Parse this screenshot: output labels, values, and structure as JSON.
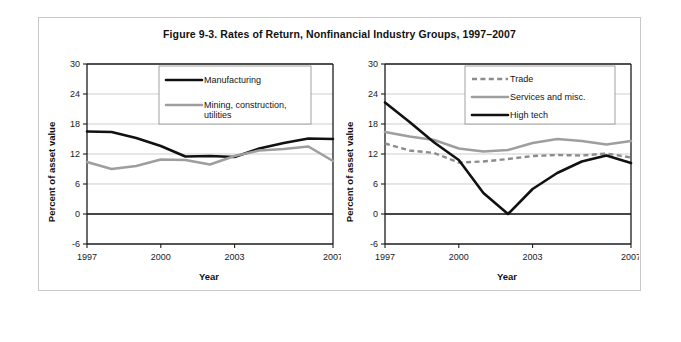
{
  "figure": {
    "title": "Figure 9-3. Rates of Return, Nonfinancial Industry Groups, 1997–2007"
  },
  "axis": {
    "ylabel": "Percent of asset value",
    "xlabel": "Year",
    "ytick_labels": [
      "30",
      "24",
      "18",
      "12",
      "6",
      "0",
      "-6"
    ],
    "xtick_labels": [
      "1997",
      "2000",
      "2003",
      "2007"
    ]
  },
  "legend_left": {
    "items": [
      {
        "label": "Manufacturing",
        "style": "solid-black",
        "color": "#111111"
      },
      {
        "label": "Mining, construction,",
        "label2": "utilities",
        "style": "solid-gray",
        "color": "#9e9e9e"
      }
    ]
  },
  "legend_right": {
    "items": [
      {
        "label": "Trade",
        "style": "dashed-gray",
        "color": "#8c8c8c"
      },
      {
        "label": "Services and misc.",
        "style": "solid-gray",
        "color": "#9e9e9e"
      },
      {
        "label": "High tech",
        "style": "solid-black",
        "color": "#111111"
      }
    ]
  },
  "chart_data": [
    {
      "type": "line",
      "title": "Rates of Return, Nonfinancial Industry Groups, 1997–2007 (panel 1)",
      "xlabel": "Year",
      "ylabel": "Percent of asset value",
      "x": [
        1997,
        1998,
        1999,
        2000,
        2001,
        2002,
        2003,
        2004,
        2005,
        2006,
        2007
      ],
      "xlim": [
        1997,
        2007
      ],
      "ylim": [
        -6,
        30
      ],
      "yticks": [
        -6,
        0,
        6,
        12,
        18,
        24,
        30
      ],
      "xticks": [
        1997,
        2000,
        2003,
        2007
      ],
      "grid": true,
      "legend_position": "top-right",
      "series": [
        {
          "name": "Manufacturing",
          "color": "#111111",
          "style": "solid",
          "values": [
            16.5,
            16.4,
            15.2,
            13.6,
            11.5,
            11.6,
            11.4,
            13.1,
            14.2,
            15.1,
            15.0
          ]
        },
        {
          "name": "Mining, construction, utilities",
          "color": "#9e9e9e",
          "style": "solid",
          "values": [
            10.4,
            9.0,
            9.6,
            10.9,
            10.8,
            9.9,
            11.6,
            12.7,
            13.0,
            13.5,
            10.6
          ]
        }
      ]
    },
    {
      "type": "line",
      "title": "Rates of Return, Nonfinancial Industry Groups, 1997–2007 (panel 2)",
      "xlabel": "Year",
      "ylabel": "Percent of asset value",
      "x": [
        1997,
        1998,
        1999,
        2000,
        2001,
        2002,
        2003,
        2004,
        2005,
        2006,
        2007
      ],
      "xlim": [
        1997,
        2007
      ],
      "ylim": [
        -6,
        30
      ],
      "yticks": [
        -6,
        0,
        6,
        12,
        18,
        24,
        30
      ],
      "xticks": [
        1997,
        2000,
        2003,
        2007
      ],
      "grid": true,
      "legend_position": "top-right",
      "series": [
        {
          "name": "Trade",
          "color": "#8c8c8c",
          "style": "dashed",
          "values": [
            14.1,
            12.7,
            12.2,
            10.3,
            10.5,
            11.0,
            11.6,
            11.8,
            11.7,
            12.1,
            11.3
          ]
        },
        {
          "name": "Services and misc.",
          "color": "#9e9e9e",
          "style": "solid",
          "values": [
            16.4,
            15.5,
            14.8,
            13.1,
            12.5,
            12.8,
            14.2,
            15.0,
            14.6,
            13.9,
            14.6
          ]
        },
        {
          "name": "High tech",
          "color": "#111111",
          "style": "solid",
          "values": [
            22.3,
            18.4,
            14.3,
            10.8,
            4.2,
            0.0,
            5.0,
            8.2,
            10.5,
            11.7,
            10.2
          ]
        }
      ]
    }
  ]
}
